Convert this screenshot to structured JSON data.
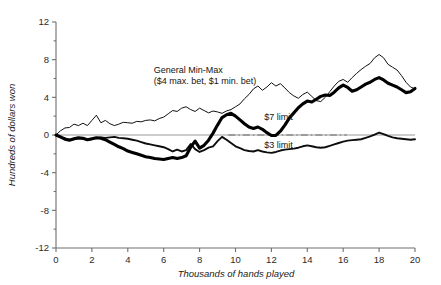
{
  "chart_data": {
    "type": "line",
    "title": "",
    "xlabel": "Thousands of hands played",
    "ylabel": "Hundreds of dollars won",
    "xlim": [
      0,
      20
    ],
    "ylim": [
      -12,
      12
    ],
    "xticks": [
      0,
      2,
      4,
      6,
      8,
      10,
      12,
      14,
      16,
      18,
      20
    ],
    "xticklabels": [
      "0",
      "2",
      "4",
      "6",
      "8",
      "10",
      "12",
      "14",
      "16",
      "18",
      "20"
    ],
    "yticks": [
      -12,
      -8,
      -4,
      0,
      4,
      8,
      12
    ],
    "yticklabels": [
      "-12",
      "-8",
      "-4",
      "0",
      "4",
      "8",
      "12"
    ],
    "yminorticks": [
      -10,
      -6,
      -2,
      2,
      6,
      10
    ],
    "grid": false,
    "legend_position": "inline-annotations",
    "zero_reference_line": true,
    "annotations": [
      {
        "name": "general-min-max-label",
        "line1": "General Min-Max",
        "line2": "($4 max. bet, $1 min. bet)",
        "x": 5.45,
        "y": 6.6
      },
      {
        "name": "seven-limit-label",
        "text": "$7 limit",
        "x": 11.6,
        "y": 1.55
      },
      {
        "name": "three-limit-label",
        "text": "$3 limit",
        "x": 11.6,
        "y": -1.35
      }
    ],
    "x": [
      0,
      0.25,
      0.5,
      0.75,
      1,
      1.25,
      1.5,
      1.75,
      2,
      2.25,
      2.5,
      2.75,
      3,
      3.25,
      3.5,
      3.75,
      4,
      4.25,
      4.5,
      4.75,
      5,
      5.25,
      5.5,
      5.75,
      6,
      6.25,
      6.5,
      6.75,
      7,
      7.25,
      7.5,
      7.75,
      8,
      8.25,
      8.5,
      8.75,
      9,
      9.25,
      9.5,
      9.75,
      10,
      10.25,
      10.5,
      10.75,
      11,
      11.25,
      11.5,
      11.75,
      12,
      12.25,
      12.5,
      12.75,
      13,
      13.25,
      13.5,
      13.75,
      14,
      14.25,
      14.5,
      14.75,
      15,
      15.25,
      15.5,
      15.75,
      16,
      16.25,
      16.5,
      16.75,
      17,
      17.25,
      17.5,
      17.75,
      18,
      18.25,
      18.5,
      18.75,
      19,
      19.25,
      19.5,
      19.75,
      20
    ],
    "series": [
      {
        "name": "General Min-Max ($4 max. bet, $1 min. bet)",
        "style": "thin",
        "values": [
          0,
          0.45,
          0.75,
          0.8,
          1.15,
          1.0,
          1.25,
          1.0,
          1.55,
          2.1,
          1.3,
          1.55,
          1.2,
          1.0,
          1.15,
          1.35,
          1.3,
          1.25,
          1.45,
          1.4,
          1.55,
          1.6,
          1.5,
          1.75,
          1.9,
          2.25,
          2.6,
          2.5,
          2.85,
          3.0,
          2.7,
          2.5,
          2.85,
          2.6,
          2.35,
          2.55,
          2.45,
          2.3,
          2.55,
          2.7,
          3.0,
          3.3,
          3.85,
          4.3,
          4.9,
          5.2,
          4.75,
          5.1,
          5.55,
          5.2,
          5.45,
          5.0,
          4.5,
          4.15,
          3.9,
          4.3,
          4.55,
          4.1,
          3.65,
          3.55,
          4.0,
          4.6,
          5.2,
          5.7,
          5.9,
          5.6,
          6.1,
          6.55,
          6.95,
          7.3,
          7.6,
          8.2,
          8.55,
          8.2,
          7.5,
          7.2,
          6.9,
          6.3,
          5.6,
          5.1,
          4.9
        ]
      },
      {
        "name": "$7 limit",
        "style": "thick",
        "values": [
          0,
          -0.2,
          -0.45,
          -0.55,
          -0.4,
          -0.3,
          -0.35,
          -0.5,
          -0.4,
          -0.3,
          -0.35,
          -0.5,
          -0.75,
          -1.0,
          -1.25,
          -1.45,
          -1.7,
          -1.85,
          -2.0,
          -2.15,
          -2.3,
          -2.4,
          -2.5,
          -2.55,
          -2.6,
          -2.5,
          -2.4,
          -2.5,
          -2.4,
          -2.2,
          -1.3,
          -0.65,
          -1.4,
          -1.1,
          -0.55,
          0.2,
          1.05,
          1.85,
          2.15,
          2.3,
          2.0,
          1.6,
          1.2,
          0.85,
          0.7,
          0.85,
          0.6,
          0.25,
          -0.05,
          -0.05,
          0.4,
          1.05,
          1.8,
          2.35,
          2.9,
          3.3,
          3.6,
          3.5,
          3.8,
          4.1,
          4.25,
          4.2,
          4.55,
          5.0,
          5.3,
          5.05,
          4.65,
          4.8,
          5.1,
          5.4,
          5.6,
          5.9,
          6.1,
          5.85,
          5.5,
          5.3,
          5.1,
          4.8,
          4.5,
          4.6,
          4.95
        ]
      },
      {
        "name": "$3 limit",
        "style": "medium",
        "values": [
          0,
          -0.25,
          -0.35,
          -0.5,
          -0.45,
          -0.35,
          -0.4,
          -0.5,
          -0.45,
          -0.3,
          -0.25,
          -0.3,
          -0.25,
          -0.2,
          -0.3,
          -0.35,
          -0.4,
          -0.5,
          -0.6,
          -0.75,
          -0.9,
          -1.0,
          -1.1,
          -1.2,
          -1.3,
          -1.5,
          -1.75,
          -1.55,
          -1.75,
          -1.6,
          -0.95,
          -1.5,
          -1.8,
          -1.6,
          -1.35,
          -1.2,
          -0.65,
          -0.2,
          -0.5,
          -0.85,
          -1.2,
          -1.4,
          -1.6,
          -1.7,
          -1.75,
          -1.6,
          -1.75,
          -1.85,
          -1.9,
          -1.8,
          -1.65,
          -1.55,
          -1.5,
          -1.45,
          -1.35,
          -1.2,
          -1.1,
          -1.2,
          -1.3,
          -1.35,
          -1.3,
          -1.15,
          -1.0,
          -0.85,
          -0.7,
          -0.6,
          -0.55,
          -0.5,
          -0.45,
          -0.3,
          -0.15,
          0.05,
          0.25,
          0.1,
          -0.1,
          -0.25,
          -0.35,
          -0.4,
          -0.45,
          -0.5,
          -0.45
        ]
      }
    ]
  }
}
